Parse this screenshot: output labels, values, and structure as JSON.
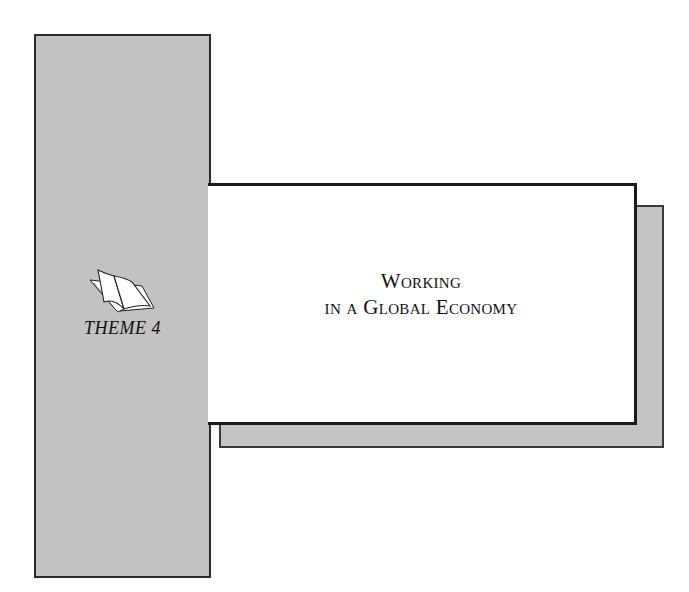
{
  "page": {
    "title_line1": "Working",
    "title_line2": "in a Global Economy",
    "theme_label": "THEME 4",
    "icons": {
      "book": "open-book-icon"
    },
    "colors": {
      "panel_gray": "#c2c2c2",
      "border": "#1a1a1a",
      "background": "#ffffff"
    }
  }
}
